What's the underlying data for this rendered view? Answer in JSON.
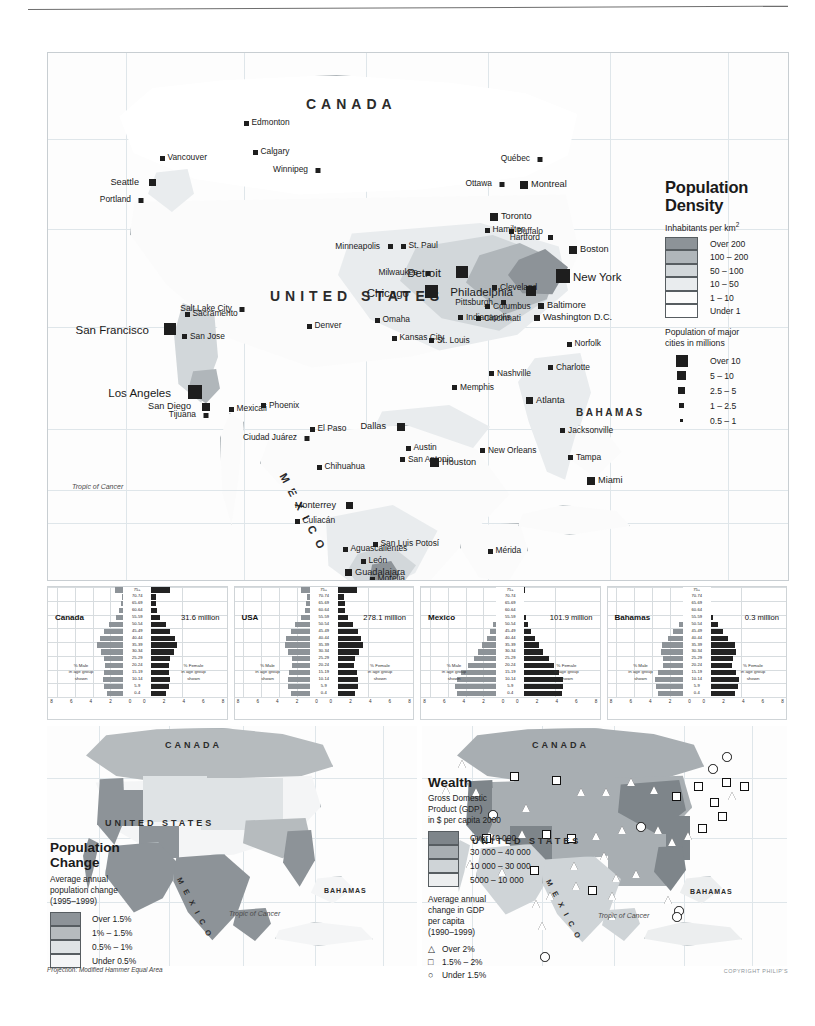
{
  "page": {
    "projection_note": "Projection: Modified Hammer Equal Area",
    "copyright": "COPYRIGHT PHILIP'S"
  },
  "density_legend": {
    "title_line1": "Population",
    "title_line2": "Density",
    "subtitle": "Inhabitants per km",
    "subtitle_sup": "2",
    "classes": [
      {
        "label": "Over 200",
        "color": "#8d9398"
      },
      {
        "label": "100 – 200",
        "color": "#b0b6ba"
      },
      {
        "label": "50 – 100",
        "color": "#d2d7da"
      },
      {
        "label": "10 – 50",
        "color": "#e9ecee"
      },
      {
        "label": "1 – 10",
        "color": "#fbfbfb"
      },
      {
        "label": "Under 1",
        "color": "#ffffff"
      }
    ],
    "cities_heading_line1": "Population of major",
    "cities_heading_line2": "cities in millions",
    "city_classes": [
      {
        "label": "Over 10",
        "size": 12
      },
      {
        "label": "5 – 10",
        "size": 9
      },
      {
        "label": "2.5 – 5",
        "size": 6.5
      },
      {
        "label": "1 – 2.5",
        "size": 4.5
      },
      {
        "label": "0.5 – 1",
        "size": 3
      }
    ]
  },
  "main_map": {
    "countries": [
      {
        "name": "CANADA",
        "x": 258,
        "y": 43,
        "size": "lg"
      },
      {
        "name": "UNITED STATES",
        "x": 222,
        "y": 235,
        "size": "lg"
      },
      {
        "name": "BAHAMAS",
        "x": 528,
        "y": 354,
        "size": "sm"
      }
    ],
    "mexico_label": "M E X I C O",
    "tropic_label": "Tropic of Cancer",
    "cities": [
      {
        "name": "Edmonton",
        "x": 196,
        "y": 68,
        "s": 4.5,
        "a": "r"
      },
      {
        "name": "Calgary",
        "x": 205,
        "y": 97,
        "s": 4.5,
        "a": "r"
      },
      {
        "name": "Vancouver",
        "x": 112,
        "y": 103,
        "s": 4.5,
        "a": "r"
      },
      {
        "name": "Seattle",
        "x": 108,
        "y": 126,
        "s": 7,
        "a": "l"
      },
      {
        "name": "Portland",
        "x": 95,
        "y": 145,
        "s": 4.5,
        "a": "l"
      },
      {
        "name": "Winnipeg",
        "x": 272,
        "y": 115,
        "s": 4.5,
        "a": "l"
      },
      {
        "name": "Québec",
        "x": 494,
        "y": 104,
        "s": 4.5,
        "a": "l"
      },
      {
        "name": "Ottawa",
        "x": 456,
        "y": 129,
        "s": 4.5,
        "a": "l"
      },
      {
        "name": "Montreal",
        "x": 472,
        "y": 128,
        "s": 8,
        "a": "r"
      },
      {
        "name": "Toronto",
        "x": 442,
        "y": 160,
        "s": 8,
        "a": "r"
      },
      {
        "name": "Hamilton",
        "x": 437,
        "y": 175,
        "s": 4.5,
        "a": "r"
      },
      {
        "name": "Buffalo",
        "x": 461,
        "y": 176,
        "s": 5,
        "a": "r"
      },
      {
        "name": "Boston",
        "x": 521,
        "y": 193,
        "s": 8,
        "a": "r"
      },
      {
        "name": "Hartford",
        "x": 505,
        "y": 182,
        "s": 5,
        "a": "l"
      },
      {
        "name": "New York",
        "x": 508,
        "y": 216,
        "s": 14,
        "a": "r",
        "big": true
      },
      {
        "name": "Philadelphia",
        "x": 488,
        "y": 233,
        "s": 10,
        "a": "l",
        "big": true
      },
      {
        "name": "Baltimore",
        "x": 490,
        "y": 250,
        "s": 6,
        "a": "r"
      },
      {
        "name": "Washington D.C.",
        "x": 486,
        "y": 262,
        "s": 6,
        "a": "r"
      },
      {
        "name": "Pittsburgh",
        "x": 458,
        "y": 247,
        "s": 5,
        "a": "l"
      },
      {
        "name": "Cleveland",
        "x": 444,
        "y": 232,
        "s": 5,
        "a": "r"
      },
      {
        "name": "Detroit",
        "x": 420,
        "y": 213,
        "s": 12,
        "a": "l",
        "big": true
      },
      {
        "name": "Chicago",
        "x": 390,
        "y": 232,
        "s": 13,
        "a": "l",
        "big": true
      },
      {
        "name": "Milwaukee",
        "x": 382,
        "y": 218,
        "s": 4.5,
        "a": "l"
      },
      {
        "name": "Minneapolis",
        "x": 345,
        "y": 191,
        "s": 5,
        "a": "l"
      },
      {
        "name": "St. Paul",
        "x": 353,
        "y": 191,
        "s": 4.5,
        "a": "r"
      },
      {
        "name": "Columbus",
        "x": 437,
        "y": 251,
        "s": 5,
        "a": "r"
      },
      {
        "name": "Cincinnati",
        "x": 428,
        "y": 263,
        "s": 5,
        "a": "r"
      },
      {
        "name": "Indianapolis",
        "x": 410,
        "y": 262,
        "s": 5,
        "a": "r"
      },
      {
        "name": "St. Louis",
        "x": 381,
        "y": 285,
        "s": 5,
        "a": "r"
      },
      {
        "name": "Kansas City",
        "x": 344,
        "y": 283,
        "s": 4.5,
        "a": "r"
      },
      {
        "name": "Omaha",
        "x": 327,
        "y": 265,
        "s": 4.5,
        "a": "r"
      },
      {
        "name": "Denver",
        "x": 259,
        "y": 271,
        "s": 4.5,
        "a": "r"
      },
      {
        "name": "Salt Lake City",
        "x": 196,
        "y": 254,
        "s": 4.5,
        "a": "l"
      },
      {
        "name": "Sacramento",
        "x": 137,
        "y": 259,
        "s": 4.5,
        "a": "r"
      },
      {
        "name": "San Francisco",
        "x": 128,
        "y": 270,
        "s": 12,
        "a": "l",
        "big": true
      },
      {
        "name": "San Jose",
        "x": 134,
        "y": 281,
        "s": 5,
        "a": "r"
      },
      {
        "name": "Los Angeles",
        "x": 154,
        "y": 332,
        "s": 14,
        "a": "l",
        "big": true
      },
      {
        "name": "San Diego",
        "x": 162,
        "y": 350,
        "s": 8,
        "a": "l"
      },
      {
        "name": "Tijuana",
        "x": 160,
        "y": 360,
        "s": 4.5,
        "a": "l"
      },
      {
        "name": "Mexicali",
        "x": 181,
        "y": 354,
        "s": 4.5,
        "a": "r"
      },
      {
        "name": "Phoenix",
        "x": 213,
        "y": 350,
        "s": 5,
        "a": "r"
      },
      {
        "name": "El Paso",
        "x": 262,
        "y": 374,
        "s": 4.5,
        "a": "r"
      },
      {
        "name": "Ciudad Juárez",
        "x": 261,
        "y": 383,
        "s": 4.5,
        "a": "l"
      },
      {
        "name": "Chihuahua",
        "x": 269,
        "y": 412,
        "s": 4.5,
        "a": "r"
      },
      {
        "name": "Dallas",
        "x": 357,
        "y": 370,
        "s": 8,
        "a": "l"
      },
      {
        "name": "Austin",
        "x": 358,
        "y": 393,
        "s": 4.5,
        "a": "r"
      },
      {
        "name": "San Antonio",
        "x": 352,
        "y": 404,
        "s": 5,
        "a": "r"
      },
      {
        "name": "Houston",
        "x": 382,
        "y": 405,
        "s": 9,
        "a": "r"
      },
      {
        "name": "New Orleans",
        "x": 432,
        "y": 395,
        "s": 5,
        "a": "r"
      },
      {
        "name": "Memphis",
        "x": 404,
        "y": 332,
        "s": 5,
        "a": "r"
      },
      {
        "name": "Nashville",
        "x": 441,
        "y": 318,
        "s": 5,
        "a": "r"
      },
      {
        "name": "Charlotte",
        "x": 500,
        "y": 312,
        "s": 5,
        "a": "r"
      },
      {
        "name": "Atlanta",
        "x": 478,
        "y": 344,
        "s": 7,
        "a": "r"
      },
      {
        "name": "Jacksonville",
        "x": 512,
        "y": 375,
        "s": 5,
        "a": "r"
      },
      {
        "name": "Tampa",
        "x": 520,
        "y": 402,
        "s": 5,
        "a": "r"
      },
      {
        "name": "Miami",
        "x": 539,
        "y": 424,
        "s": 8,
        "a": "r"
      },
      {
        "name": "Norfolk",
        "x": 519,
        "y": 289,
        "s": 4.5,
        "a": "r"
      },
      {
        "name": "Monterrey",
        "x": 305,
        "y": 449,
        "s": 7,
        "a": "l"
      },
      {
        "name": "Culiacán",
        "x": 247,
        "y": 466,
        "s": 4.5,
        "a": "r"
      },
      {
        "name": "Aguascalientes",
        "x": 295,
        "y": 494,
        "s": 4.5,
        "a": "r"
      },
      {
        "name": "San Luis Potosí",
        "x": 325,
        "y": 489,
        "s": 4.5,
        "a": "r"
      },
      {
        "name": "León",
        "x": 313,
        "y": 506,
        "s": 4.5,
        "a": "r"
      },
      {
        "name": "Guadalajara",
        "x": 297,
        "y": 516,
        "s": 7,
        "a": "r"
      },
      {
        "name": "Morelia",
        "x": 322,
        "y": 524,
        "s": 4.5,
        "a": "r"
      },
      {
        "name": "Mexico City",
        "x": 327,
        "y": 530,
        "s": 14,
        "a": "l",
        "big": true
      },
      {
        "name": "Puebla",
        "x": 348,
        "y": 533,
        "s": 5,
        "a": "r"
      },
      {
        "name": "Acapulco",
        "x": 325,
        "y": 552,
        "s": 4.5,
        "a": "r"
      },
      {
        "name": "Mérida",
        "x": 440,
        "y": 496,
        "s": 4.5,
        "a": "r"
      }
    ]
  },
  "pyramids": {
    "age_groups": [
      "75+",
      "70-74",
      "65-69",
      "60-64",
      "55-59",
      "50-54",
      "45-49",
      "40-44",
      "35-39",
      "30-34",
      "25-29",
      "20-24",
      "15-19",
      "10-14",
      "5-9",
      "0-4"
    ],
    "axis_ticks": [
      "8",
      "6",
      "4",
      "2",
      "0",
      "0",
      "2",
      "4",
      "6",
      "8"
    ],
    "male_note_lines": [
      "% Male",
      "in age group",
      "shown"
    ],
    "female_note_lines": [
      "% Female",
      "in age group",
      "shown"
    ],
    "countries": [
      {
        "name": "Canada",
        "population": "31.6 million",
        "male": [
          2.2,
          1.4,
          1.5,
          1.7,
          2.1,
          2.8,
          3.4,
          3.9,
          4.2,
          3.8,
          3.4,
          3.3,
          3.4,
          3.5,
          3.4,
          3.1
        ],
        "female": [
          3.4,
          1.8,
          1.8,
          1.9,
          2.2,
          2.9,
          3.4,
          3.9,
          4.2,
          3.8,
          3.4,
          3.2,
          3.3,
          3.4,
          3.2,
          2.9
        ]
      },
      {
        "name": "USA",
        "population": "278.1 million",
        "male": [
          2.2,
          1.5,
          1.7,
          1.8,
          2.2,
          2.9,
          3.4,
          3.9,
          4.1,
          3.7,
          3.3,
          3.2,
          3.6,
          3.7,
          3.7,
          3.4
        ],
        "female": [
          3.4,
          1.9,
          2.0,
          2.1,
          2.4,
          3.0,
          3.5,
          3.9,
          4.1,
          3.6,
          3.2,
          3.1,
          3.4,
          3.5,
          3.5,
          3.2
        ]
      },
      {
        "name": "Mexico",
        "population": "101.9 million",
        "male": [
          1.1,
          0.7,
          0.9,
          1.1,
          1.3,
          1.6,
          1.9,
          2.3,
          2.8,
          3.3,
          3.8,
          4.4,
          5.2,
          5.7,
          5.9,
          5.7
        ],
        "female": [
          1.3,
          0.8,
          1.0,
          1.2,
          1.4,
          1.7,
          2.0,
          2.4,
          2.9,
          3.4,
          4.0,
          4.6,
          5.2,
          5.6,
          5.7,
          5.5
        ]
      },
      {
        "name": "Bahamas",
        "population": "0.3 million",
        "male": [
          0.9,
          0.6,
          0.8,
          1.0,
          1.2,
          1.7,
          2.3,
          2.9,
          3.6,
          3.7,
          3.5,
          3.5,
          4.0,
          4.4,
          4.3,
          4.1
        ],
        "female": [
          1.3,
          0.8,
          1.0,
          1.2,
          1.5,
          2.0,
          2.6,
          3.2,
          4.0,
          4.1,
          3.8,
          3.7,
          4.1,
          4.4,
          4.3,
          4.0
        ]
      }
    ]
  },
  "change_map": {
    "countries": [
      {
        "name": "CANADA",
        "x": 118,
        "y": 14,
        "size": "lg"
      },
      {
        "name": "UNITED STATES",
        "x": 58,
        "y": 92,
        "size": "lg"
      },
      {
        "name": "BAHAMAS",
        "x": 277,
        "y": 161,
        "size": "sm"
      }
    ],
    "mexico_label": "M E X I C O",
    "tropic_label": "Tropic of Cancer"
  },
  "change_legend": {
    "title_line1": "Population",
    "title_line2": "Change",
    "note_lines": [
      "Average annual",
      "population change",
      "(1995–1999)"
    ],
    "classes": [
      {
        "label": "Over 1.5%",
        "color": "#8d9398"
      },
      {
        "label": "1% – 1.5%",
        "color": "#b6bbbe"
      },
      {
        "label": "0.5% – 1%",
        "color": "#dfe3e5"
      },
      {
        "label": "Under 0.5%",
        "color": "#f4f5f6"
      }
    ]
  },
  "wealth_map": {
    "countries": [
      {
        "name": "CANADA",
        "x": 110,
        "y": 14,
        "size": "lg"
      },
      {
        "name": "UNITED STATES",
        "x": 50,
        "y": 110,
        "size": "lg"
      },
      {
        "name": "BAHAMAS",
        "x": 268,
        "y": 162,
        "size": "sm"
      }
    ],
    "mexico_label": "M E X I C O",
    "tropic_label": "Tropic of Cancer"
  },
  "wealth_legend": {
    "title": "Wealth",
    "note_lines": [
      "Gross Domestic",
      "Product (GDP)",
      "in $ per capita 2000"
    ],
    "classes": [
      {
        "label": "Over 40 000",
        "color": "#7e858a"
      },
      {
        "label": "30 000 – 40 000",
        "color": "#a8aeb2"
      },
      {
        "label": "10 000 – 30 000",
        "color": "#cfd4d7"
      },
      {
        "label": "5000 – 10 000",
        "color": "#eceeef"
      }
    ],
    "symbol_note_lines": [
      "Average annual",
      "change in GDP",
      "per capita",
      "(1990–1999)"
    ],
    "symbols": [
      {
        "glyph": "△",
        "label": "Over 2%",
        "kind": "triangle"
      },
      {
        "glyph": "□",
        "label": "1.5% – 2%",
        "kind": "square"
      },
      {
        "glyph": "○",
        "label": "Under 1.5%",
        "kind": "circle"
      }
    ]
  }
}
